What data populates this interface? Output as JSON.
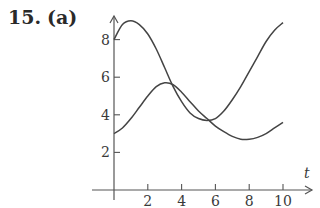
{
  "problem": {
    "number": "15.",
    "part": "(a)"
  },
  "chart_data": {
    "type": "line",
    "title": "",
    "xlabel": "t",
    "ylabel": "",
    "xlim": [
      0,
      11.5
    ],
    "ylim": [
      0,
      9.5
    ],
    "grid": false,
    "legend": null,
    "x_ticks": [
      2,
      4,
      6,
      8,
      10
    ],
    "y_ticks": [
      2,
      4,
      6,
      8
    ],
    "series": [
      {
        "name": "curve-1",
        "x": [
          0,
          0.5,
          1,
          1.5,
          2,
          2.5,
          3,
          3.5,
          4,
          4.5,
          5,
          5.5,
          6,
          6.5,
          7,
          7.5,
          8,
          8.5,
          9,
          9.5,
          10
        ],
        "values": [
          8.0,
          8.8,
          9.0,
          8.8,
          8.3,
          7.5,
          6.5,
          5.5,
          4.7,
          4.1,
          3.8,
          3.7,
          3.8,
          4.2,
          4.8,
          5.5,
          6.3,
          7.1,
          7.9,
          8.5,
          8.9
        ]
      },
      {
        "name": "curve-2",
        "x": [
          0,
          0.5,
          1,
          1.5,
          2,
          2.5,
          3,
          3.5,
          4,
          4.5,
          5,
          5.5,
          6,
          6.5,
          7,
          7.5,
          8,
          8.5,
          9,
          9.5,
          10
        ],
        "values": [
          3.0,
          3.3,
          3.8,
          4.4,
          5.0,
          5.5,
          5.7,
          5.6,
          5.2,
          4.7,
          4.2,
          3.8,
          3.4,
          3.1,
          2.85,
          2.7,
          2.7,
          2.8,
          3.0,
          3.3,
          3.6
        ]
      }
    ]
  }
}
